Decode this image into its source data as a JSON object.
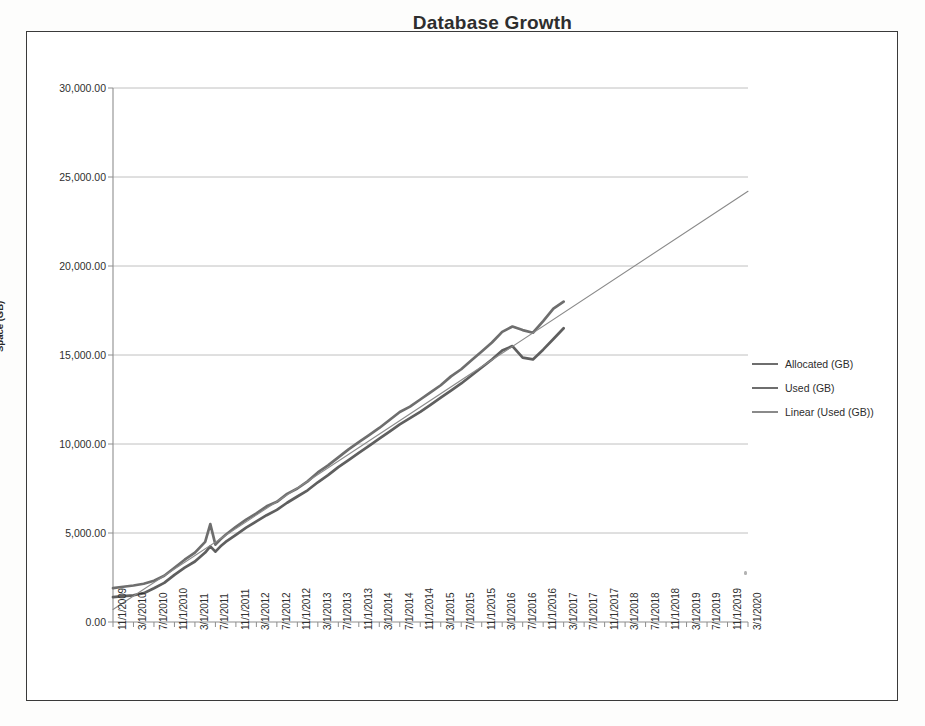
{
  "document": {
    "kind": "scanned-chart-page",
    "frame_visible": true
  },
  "chart_data": {
    "type": "line",
    "title": "Database Growth",
    "xlabel": "",
    "ylabel": "Space (GB)",
    "ylim": [
      0,
      30000
    ],
    "ytick_labels": [
      "30,000.00",
      "25,000.00",
      "20,000.00",
      "15,000.00",
      "10,000.00",
      "5,000.00",
      "0.00"
    ],
    "ytick_values": [
      30000,
      25000,
      20000,
      15000,
      10000,
      5000,
      0
    ],
    "grid": "horizontal",
    "legend_position": "right",
    "legend": [
      "Allocated (GB)",
      "Used (GB)",
      "Linear (Used (GB))"
    ],
    "colors": {
      "allocated": "#6e6e6e",
      "used": "#5f5f5f",
      "trendline": "#8a8a8a",
      "grid": "#b9b9b9",
      "axis": "#8e8e8e"
    },
    "xtick_labels": [
      "11/1/2009",
      "3/1/2010",
      "7/1/2010",
      "11/1/2010",
      "3/1/2011",
      "7/1/2011",
      "11/1/2011",
      "3/1/2012",
      "7/1/2012",
      "11/1/2012",
      "3/1/2013",
      "7/1/2013",
      "11/1/2013",
      "3/1/2014",
      "7/1/2014",
      "11/1/2014",
      "3/1/2015",
      "7/1/2015",
      "11/1/2015",
      "3/1/2016",
      "7/1/2016",
      "11/1/2016",
      "3/1/2017",
      "7/1/2017",
      "11/1/2017",
      "3/1/2018",
      "7/1/2018",
      "11/1/2018",
      "3/1/2019",
      "7/1/2019",
      "11/1/2019",
      "3/1/2020"
    ],
    "x_axis_start": "11/1/2009",
    "x_axis_end": "3/1/2020",
    "x_data_end": "3/1/2017",
    "x_step_months": 4,
    "x_months_total": 124,
    "series": [
      {
        "name": "Allocated (GB)",
        "style": "thick-line",
        "x_months": [
          0,
          2,
          4,
          6,
          8,
          10,
          12,
          14,
          16,
          18,
          19,
          20,
          21,
          22,
          24,
          26,
          28,
          30,
          32,
          34,
          36,
          38,
          40,
          42,
          44,
          46,
          48,
          50,
          52,
          54,
          56,
          58,
          60,
          62,
          64,
          66,
          68,
          70,
          72,
          74,
          76,
          78,
          80,
          82,
          84,
          86,
          88
        ],
        "values": [
          1900,
          1980,
          2050,
          2150,
          2320,
          2600,
          3050,
          3500,
          3900,
          4500,
          5500,
          4350,
          4650,
          4900,
          5350,
          5750,
          6100,
          6500,
          6750,
          7200,
          7500,
          7900,
          8400,
          8800,
          9250,
          9700,
          10100,
          10500,
          10900,
          11350,
          11800,
          12100,
          12500,
          12900,
          13300,
          13800,
          14200,
          14700,
          15200,
          15700,
          16300,
          16600,
          16400,
          16250,
          16900,
          17600,
          18000
        ]
      },
      {
        "name": "Used (GB)",
        "style": "thick-line",
        "x_months": [
          0,
          2,
          4,
          6,
          8,
          10,
          12,
          14,
          16,
          18,
          19,
          20,
          21,
          22,
          24,
          26,
          28,
          30,
          32,
          34,
          36,
          38,
          40,
          42,
          44,
          46,
          48,
          50,
          52,
          54,
          56,
          58,
          60,
          62,
          64,
          66,
          68,
          70,
          72,
          74,
          76,
          78,
          80,
          82,
          84,
          86,
          88
        ],
        "values": [
          1400,
          1450,
          1500,
          1620,
          1900,
          2200,
          2650,
          3050,
          3400,
          3900,
          4250,
          3950,
          4250,
          4500,
          4900,
          5300,
          5650,
          6000,
          6300,
          6700,
          7050,
          7400,
          7850,
          8250,
          8700,
          9100,
          9500,
          9900,
          10300,
          10700,
          11100,
          11450,
          11800,
          12200,
          12600,
          13000,
          13400,
          13850,
          14300,
          14750,
          15250,
          15500,
          14850,
          14750,
          15300,
          15900,
          16500
        ]
      },
      {
        "name": "Linear (Used (GB))",
        "style": "thin-trendline",
        "x_months": [
          0,
          124
        ],
        "values": [
          700,
          24200
        ]
      }
    ]
  }
}
